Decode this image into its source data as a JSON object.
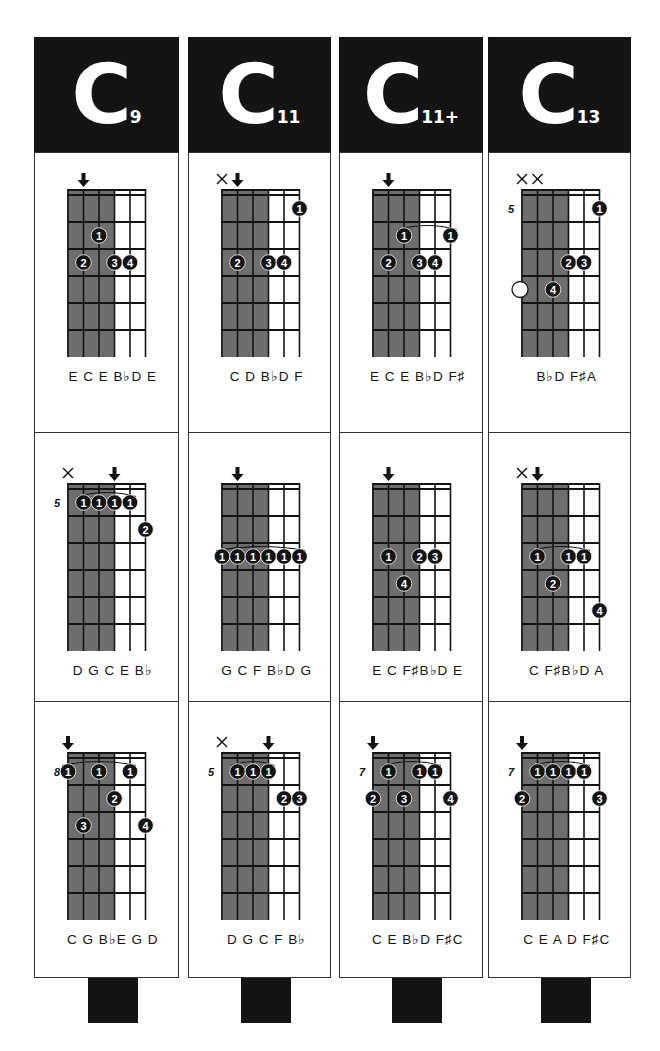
{
  "page": {
    "type": "guitar chord chart",
    "background": "#ffffff",
    "ink": "#141414",
    "shade": "#6e6e6e"
  },
  "columns": [
    {
      "root": "C",
      "extension": "9",
      "name": "C9",
      "x": 34,
      "width": 145,
      "diagrams": [
        {
          "position_label": "",
          "markers": [
            {
              "string": 2,
              "type": "root-arrow"
            }
          ],
          "dots": [
            {
              "string": 3,
              "fret": 2,
              "finger": "1"
            },
            {
              "string": 2,
              "fret": 3,
              "finger": "2"
            },
            {
              "string": 4,
              "fret": 3,
              "finger": "3"
            },
            {
              "string": 5,
              "fret": 3,
              "finger": "4"
            }
          ],
          "barres": [],
          "notes": "E C E B♭D E"
        },
        {
          "position_label": "5",
          "markers": [
            {
              "string": 1,
              "type": "mute"
            },
            {
              "string": 4,
              "type": "root-arrow"
            }
          ],
          "dots": [
            {
              "string": 2,
              "fret": 1,
              "finger": "1"
            },
            {
              "string": 3,
              "fret": 1,
              "finger": "1"
            },
            {
              "string": 4,
              "fret": 1,
              "finger": "1"
            },
            {
              "string": 5,
              "fret": 1,
              "finger": "1"
            },
            {
              "string": 6,
              "fret": 2,
              "finger": "2"
            }
          ],
          "barres": [
            {
              "fret": 1,
              "from": 2,
              "to": 5
            }
          ],
          "notes": "D G C E B♭"
        },
        {
          "position_label": "8",
          "markers": [
            {
              "string": 1,
              "type": "root-arrow"
            }
          ],
          "dots": [
            {
              "string": 1,
              "fret": 1,
              "finger": "1"
            },
            {
              "string": 3,
              "fret": 1,
              "finger": "1"
            },
            {
              "string": 5,
              "fret": 1,
              "finger": "1"
            },
            {
              "string": 4,
              "fret": 2,
              "finger": "2"
            },
            {
              "string": 2,
              "fret": 3,
              "finger": "3"
            },
            {
              "string": 6,
              "fret": 3,
              "finger": "4"
            }
          ],
          "barres": [
            {
              "fret": 1,
              "from": 1,
              "to": 5
            }
          ],
          "notes": "C G B♭E G D"
        }
      ]
    },
    {
      "root": "C",
      "extension": "11",
      "name": "C11",
      "x": 188,
      "width": 143,
      "diagrams": [
        {
          "position_label": "",
          "markers": [
            {
              "string": 1,
              "type": "mute"
            },
            {
              "string": 2,
              "type": "root-arrow"
            }
          ],
          "dots": [
            {
              "string": 6,
              "fret": 1,
              "finger": "1"
            },
            {
              "string": 2,
              "fret": 3,
              "finger": "2"
            },
            {
              "string": 4,
              "fret": 3,
              "finger": "3"
            },
            {
              "string": 5,
              "fret": 3,
              "finger": "4"
            }
          ],
          "barres": [],
          "notes": "C D B♭D F"
        },
        {
          "position_label": "",
          "markers": [
            {
              "string": 2,
              "type": "root-arrow"
            }
          ],
          "dots": [
            {
              "string": 1,
              "fret": 3,
              "finger": "1"
            },
            {
              "string": 2,
              "fret": 3,
              "finger": "1"
            },
            {
              "string": 3,
              "fret": 3,
              "finger": "1"
            },
            {
              "string": 4,
              "fret": 3,
              "finger": "1"
            },
            {
              "string": 5,
              "fret": 3,
              "finger": "1"
            },
            {
              "string": 6,
              "fret": 3,
              "finger": "1"
            }
          ],
          "barres": [
            {
              "fret": 3,
              "from": 1,
              "to": 6
            }
          ],
          "notes": "G C F B♭D G"
        },
        {
          "position_label": "5",
          "markers": [
            {
              "string": 1,
              "type": "mute"
            },
            {
              "string": 4,
              "type": "root-arrow"
            }
          ],
          "dots": [
            {
              "string": 2,
              "fret": 1,
              "finger": "1"
            },
            {
              "string": 3,
              "fret": 1,
              "finger": "1"
            },
            {
              "string": 4,
              "fret": 1,
              "finger": "1"
            },
            {
              "string": 5,
              "fret": 2,
              "finger": "2"
            },
            {
              "string": 6,
              "fret": 2,
              "finger": "3"
            }
          ],
          "barres": [
            {
              "fret": 1,
              "from": 2,
              "to": 4
            }
          ],
          "notes": "D G C F B♭"
        }
      ]
    },
    {
      "root": "C",
      "extension": "11+",
      "name": "C11+",
      "x": 339,
      "width": 144,
      "diagrams": [
        {
          "position_label": "",
          "markers": [
            {
              "string": 2,
              "type": "root-arrow"
            }
          ],
          "dots": [
            {
              "string": 3,
              "fret": 2,
              "finger": "1"
            },
            {
              "string": 6,
              "fret": 2,
              "finger": "1"
            },
            {
              "string": 2,
              "fret": 3,
              "finger": "2"
            },
            {
              "string": 4,
              "fret": 3,
              "finger": "3"
            },
            {
              "string": 5,
              "fret": 3,
              "finger": "4"
            }
          ],
          "barres": [
            {
              "fret": 2,
              "from": 3,
              "to": 6
            }
          ],
          "notes": "E C E B♭D F♯"
        },
        {
          "position_label": "",
          "markers": [
            {
              "string": 2,
              "type": "root-arrow"
            }
          ],
          "dots": [
            {
              "string": 2,
              "fret": 3,
              "finger": "1"
            },
            {
              "string": 4,
              "fret": 3,
              "finger": "2"
            },
            {
              "string": 5,
              "fret": 3,
              "finger": "3"
            },
            {
              "string": 3,
              "fret": 4,
              "finger": "4"
            }
          ],
          "barres": [],
          "notes": "E C F♯B♭D E"
        },
        {
          "position_label": "7",
          "markers": [
            {
              "string": 1,
              "type": "root-arrow"
            }
          ],
          "dots": [
            {
              "string": 2,
              "fret": 1,
              "finger": "1"
            },
            {
              "string": 4,
              "fret": 1,
              "finger": "1"
            },
            {
              "string": 5,
              "fret": 1,
              "finger": "1"
            },
            {
              "string": 1,
              "fret": 2,
              "finger": "2"
            },
            {
              "string": 3,
              "fret": 2,
              "finger": "3"
            },
            {
              "string": 6,
              "fret": 2,
              "finger": "4"
            }
          ],
          "barres": [
            {
              "fret": 1,
              "from": 2,
              "to": 5
            }
          ],
          "notes": "C E B♭D F♯C"
        }
      ]
    },
    {
      "root": "C",
      "extension": "13",
      "name": "C13",
      "x": 488,
      "width": 143,
      "diagrams": [
        {
          "position_label": "5",
          "markers": [
            {
              "string": 1,
              "type": "mute"
            },
            {
              "string": 2,
              "type": "mute"
            }
          ],
          "dots": [
            {
              "string": 6,
              "fret": 1,
              "finger": "1"
            },
            {
              "string": 4,
              "fret": 3,
              "finger": "2"
            },
            {
              "string": 5,
              "fret": 3,
              "finger": "3"
            },
            {
              "string": 3,
              "fret": 4,
              "finger": "4"
            }
          ],
          "open_circles": [
            {
              "string": 1,
              "fret": 4
            }
          ],
          "barres": [],
          "notes": "B♭D F♯A"
        },
        {
          "position_label": "",
          "markers": [
            {
              "string": 1,
              "type": "mute"
            },
            {
              "string": 2,
              "type": "root-arrow"
            }
          ],
          "dots": [
            {
              "string": 2,
              "fret": 3,
              "finger": "1"
            },
            {
              "string": 4,
              "fret": 3,
              "finger": "1"
            },
            {
              "string": 5,
              "fret": 3,
              "finger": "1"
            },
            {
              "string": 3,
              "fret": 4,
              "finger": "2"
            },
            {
              "string": 6,
              "fret": 5,
              "finger": "4"
            }
          ],
          "barres": [
            {
              "fret": 3,
              "from": 2,
              "to": 5
            }
          ],
          "notes": "C F♯B♭D A"
        },
        {
          "position_label": "7",
          "markers": [
            {
              "string": 1,
              "type": "root-arrow"
            }
          ],
          "dots": [
            {
              "string": 2,
              "fret": 1,
              "finger": "1"
            },
            {
              "string": 3,
              "fret": 1,
              "finger": "1"
            },
            {
              "string": 4,
              "fret": 1,
              "finger": "1"
            },
            {
              "string": 5,
              "fret": 1,
              "finger": "1"
            },
            {
              "string": 1,
              "fret": 2,
              "finger": "2"
            },
            {
              "string": 6,
              "fret": 2,
              "finger": "3"
            }
          ],
          "barres": [
            {
              "fret": 1,
              "from": 2,
              "to": 5
            }
          ],
          "notes": "C E A D F♯C"
        }
      ]
    }
  ]
}
